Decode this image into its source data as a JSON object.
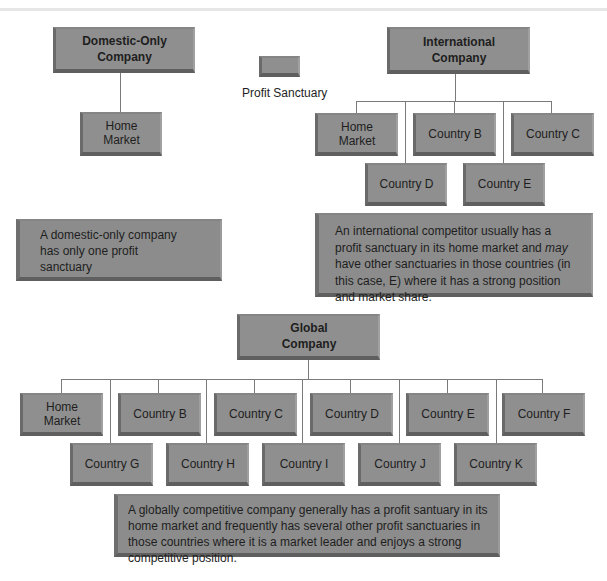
{
  "legend": {
    "label": "Profit Sanctuary",
    "swatch_color": "#8f8f8f"
  },
  "domestic": {
    "title": "Domestic-Only\nCompany",
    "markets": [
      {
        "label": "Home\nMarket"
      }
    ],
    "note": "A domestic-only company\nhas only one profit\nsanctuary"
  },
  "international": {
    "title": "International\nCompany",
    "markets": [
      {
        "label": "Home\nMarket"
      },
      {
        "label": "Country B"
      },
      {
        "label": "Country C"
      },
      {
        "label": "Country D"
      },
      {
        "label": "Country E"
      }
    ],
    "note_part1": "An international competitor usually has a profit sanctuary in its home market and ",
    "note_emphasis": "may",
    "note_part2": " have other sanctuaries in those countries (in this case, E) where it has a strong position and market share."
  },
  "global": {
    "title": "Global\nCompany",
    "markets": [
      {
        "label": "Home\nMarket"
      },
      {
        "label": "Country B"
      },
      {
        "label": "Country C"
      },
      {
        "label": "Country D"
      },
      {
        "label": "Country E"
      },
      {
        "label": "Country F"
      },
      {
        "label": "Country G"
      },
      {
        "label": "Country H"
      },
      {
        "label": "Country I"
      },
      {
        "label": "Country J"
      },
      {
        "label": "Country K"
      }
    ],
    "note": "A globally competitive company generally has a profit santuary in its home market and frequently has several other profit sanctuaries in those countries where it is a market leader and enjoys a strong competitive position."
  },
  "colors": {
    "box_fill": "#8f8f8f",
    "box_shadow": "#5f5f5f",
    "connector": "#7a7a7a",
    "background": "#ffffff"
  }
}
